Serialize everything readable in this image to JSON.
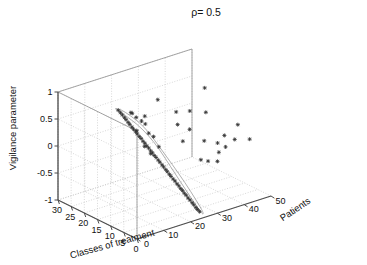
{
  "chart_data": {
    "type": "scatter",
    "projection": "3d",
    "title": "ρ= 0.5",
    "xlabel": "Classes of treatment",
    "ylabel": "Patients",
    "zlabel": "Vigilance parameter",
    "grid": true,
    "legend": null,
    "marker": "plus-star",
    "marker_color": "#333333",
    "outline_color": "#9a9a9a",
    "axis_color": "#4d4d4d",
    "grid_color": "#bdbdbd",
    "xlim": [
      0,
      30
    ],
    "ylim": [
      0,
      50
    ],
    "zlim": [
      -1,
      1
    ],
    "x_ticks": [
      30,
      25,
      20,
      15,
      10,
      5,
      0
    ],
    "y_ticks": [
      0,
      10,
      20,
      30,
      40,
      50
    ],
    "z_ticks": [
      1,
      0.5,
      0,
      -0.5,
      -1
    ],
    "x_reversed": true,
    "annotation": "Dense band of points enclosed by a closed contour outline running from upper-left (high vigilance, few patients) down to lower-right (low vigilance, more patients); sparse scattered points fill the right-hand region.",
    "points": [
      {
        "x": 13.2,
        "y": 6.0,
        "z": 0.97
      },
      {
        "x": 13.0,
        "y": 6.6,
        "z": 0.92
      },
      {
        "x": 12.7,
        "y": 7.0,
        "z": 0.88
      },
      {
        "x": 12.4,
        "y": 7.5,
        "z": 0.83
      },
      {
        "x": 12.2,
        "y": 7.9,
        "z": 0.79
      },
      {
        "x": 11.9,
        "y": 8.4,
        "z": 0.74
      },
      {
        "x": 11.7,
        "y": 8.8,
        "z": 0.7
      },
      {
        "x": 11.4,
        "y": 9.3,
        "z": 0.65
      },
      {
        "x": 11.2,
        "y": 9.7,
        "z": 0.61
      },
      {
        "x": 10.9,
        "y": 10.2,
        "z": 0.56
      },
      {
        "x": 10.7,
        "y": 10.6,
        "z": 0.52
      },
      {
        "x": 10.4,
        "y": 11.1,
        "z": 0.47
      },
      {
        "x": 10.2,
        "y": 11.6,
        "z": 0.43
      },
      {
        "x": 9.9,
        "y": 12.0,
        "z": 0.38
      },
      {
        "x": 9.7,
        "y": 12.5,
        "z": 0.34
      },
      {
        "x": 9.4,
        "y": 12.9,
        "z": 0.29
      },
      {
        "x": 9.2,
        "y": 13.4,
        "z": 0.25
      },
      {
        "x": 8.9,
        "y": 13.8,
        "z": 0.2
      },
      {
        "x": 8.7,
        "y": 14.3,
        "z": 0.16
      },
      {
        "x": 8.4,
        "y": 14.7,
        "z": 0.11
      },
      {
        "x": 8.2,
        "y": 15.2,
        "z": 0.07
      },
      {
        "x": 7.9,
        "y": 15.7,
        "z": 0.02
      },
      {
        "x": 7.7,
        "y": 16.1,
        "z": -0.02
      },
      {
        "x": 7.4,
        "y": 16.6,
        "z": -0.07
      },
      {
        "x": 7.2,
        "y": 17.0,
        "z": -0.11
      },
      {
        "x": 6.9,
        "y": 17.5,
        "z": -0.16
      },
      {
        "x": 6.7,
        "y": 17.9,
        "z": -0.2
      },
      {
        "x": 6.4,
        "y": 18.4,
        "z": -0.25
      },
      {
        "x": 6.2,
        "y": 18.8,
        "z": -0.29
      },
      {
        "x": 5.9,
        "y": 19.3,
        "z": -0.34
      },
      {
        "x": 5.7,
        "y": 19.8,
        "z": -0.38
      },
      {
        "x": 5.4,
        "y": 20.2,
        "z": -0.43
      },
      {
        "x": 5.2,
        "y": 20.7,
        "z": -0.47
      },
      {
        "x": 4.9,
        "y": 21.1,
        "z": -0.52
      },
      {
        "x": 4.7,
        "y": 21.6,
        "z": -0.56
      },
      {
        "x": 4.4,
        "y": 22.0,
        "z": -0.61
      },
      {
        "x": 4.2,
        "y": 22.5,
        "z": -0.65
      },
      {
        "x": 3.9,
        "y": 22.9,
        "z": -0.7
      },
      {
        "x": 3.7,
        "y": 23.4,
        "z": -0.74
      },
      {
        "x": 3.4,
        "y": 23.9,
        "z": -0.79
      },
      {
        "x": 3.2,
        "y": 24.3,
        "z": -0.83
      },
      {
        "x": 2.9,
        "y": 24.8,
        "z": -0.88
      },
      {
        "x": 2.7,
        "y": 25.2,
        "z": -0.92
      },
      {
        "x": 2.4,
        "y": 25.7,
        "z": -0.96
      },
      {
        "x": 12.0,
        "y": 9.5,
        "z": 0.9
      },
      {
        "x": 11.5,
        "y": 11.0,
        "z": 0.8
      },
      {
        "x": 11.0,
        "y": 12.5,
        "z": 0.72
      },
      {
        "x": 10.3,
        "y": 10.0,
        "z": 0.6
      },
      {
        "x": 9.8,
        "y": 14.0,
        "z": 0.5
      },
      {
        "x": 10.6,
        "y": 13.5,
        "z": 0.66
      },
      {
        "x": 8.8,
        "y": 11.5,
        "z": 0.32
      },
      {
        "x": 8.0,
        "y": 13.0,
        "z": 0.18
      },
      {
        "x": 12.5,
        "y": 10.5,
        "z": 0.86
      },
      {
        "x": 11.8,
        "y": 14.5,
        "z": 0.76
      },
      {
        "x": 9.0,
        "y": 17.0,
        "z": 0.22
      },
      {
        "x": 10.0,
        "y": 16.0,
        "z": 0.4
      },
      {
        "x": 14.5,
        "y": 22.0,
        "z": 0.88
      },
      {
        "x": 12.6,
        "y": 27.0,
        "z": 0.62
      },
      {
        "x": 9.0,
        "y": 24.0,
        "z": 0.52
      },
      {
        "x": 12.0,
        "y": 31.5,
        "z": 0.58
      },
      {
        "x": 10.5,
        "y": 36.0,
        "z": 0.52
      },
      {
        "x": 15.0,
        "y": 40.0,
        "z": 0.8
      },
      {
        "x": 7.5,
        "y": 27.0,
        "z": 0.42
      },
      {
        "x": 6.0,
        "y": 23.0,
        "z": 0.3
      },
      {
        "x": 5.0,
        "y": 30.0,
        "z": 0.22
      },
      {
        "x": 4.0,
        "y": 34.0,
        "z": 0.14
      },
      {
        "x": 3.0,
        "y": 36.0,
        "z": 0.06
      },
      {
        "x": 2.5,
        "y": 33.0,
        "z": 0.02
      },
      {
        "x": 3.6,
        "y": 40.0,
        "z": 0.12
      },
      {
        "x": 2.0,
        "y": 44.0,
        "z": 0.1
      },
      {
        "x": 6.5,
        "y": 44.0,
        "z": 0.26
      },
      {
        "x": 5.5,
        "y": 38.0,
        "z": 0.18
      },
      {
        "x": 1.5,
        "y": 28.0,
        "z": -0.04
      },
      {
        "x": 2.2,
        "y": 26.0,
        "z": 0.0
      },
      {
        "x": 1.0,
        "y": 31.0,
        "z": -0.08
      }
    ],
    "contour": [
      {
        "x": 13.6,
        "y": 5.3,
        "z": 1.0
      },
      {
        "x": 14.0,
        "y": 7.5,
        "z": 0.95
      },
      {
        "x": 13.2,
        "y": 10.5,
        "z": 0.8
      },
      {
        "x": 12.0,
        "y": 13.5,
        "z": 0.62
      },
      {
        "x": 10.4,
        "y": 15.5,
        "z": 0.42
      },
      {
        "x": 8.6,
        "y": 17.2,
        "z": 0.2
      },
      {
        "x": 6.6,
        "y": 19.5,
        "z": -0.08
      },
      {
        "x": 4.6,
        "y": 22.4,
        "z": -0.42
      },
      {
        "x": 2.8,
        "y": 25.0,
        "z": -0.76
      },
      {
        "x": 1.8,
        "y": 26.6,
        "z": -0.98
      },
      {
        "x": 0.9,
        "y": 25.4,
        "z": -0.98
      },
      {
        "x": 1.9,
        "y": 23.2,
        "z": -0.74
      },
      {
        "x": 3.6,
        "y": 20.6,
        "z": -0.42
      },
      {
        "x": 5.6,
        "y": 18.0,
        "z": -0.08
      },
      {
        "x": 7.4,
        "y": 15.8,
        "z": 0.22
      },
      {
        "x": 9.2,
        "y": 13.4,
        "z": 0.48
      },
      {
        "x": 10.8,
        "y": 10.6,
        "z": 0.7
      },
      {
        "x": 11.9,
        "y": 7.4,
        "z": 0.88
      },
      {
        "x": 12.6,
        "y": 5.2,
        "z": 1.0
      },
      {
        "x": 13.6,
        "y": 5.3,
        "z": 1.0
      }
    ]
  }
}
